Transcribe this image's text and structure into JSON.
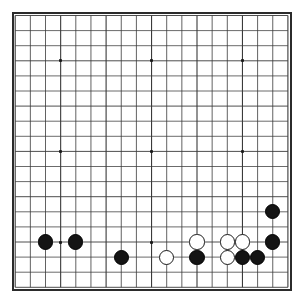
{
  "board": {
    "game": "Go",
    "size": 19,
    "columns": 19,
    "rows": 19,
    "label": "go-board-19x19",
    "colors": {
      "background": "#ffffff",
      "grid_line": "#3a3a3a",
      "border": "#2b2b2b",
      "black_stone": "#141414",
      "white_stone": "#ffffff",
      "white_stone_outline": "#1a1a1a",
      "hoshi": "#1b1b1b"
    },
    "geometry": {
      "origin_x": 15.2,
      "origin_y": 15.5,
      "spacing_x": 15.15,
      "spacing_y": 15.1,
      "stone_radius": 7.6,
      "hoshi_size": 3
    },
    "hoshi_points": [
      {
        "col": 4,
        "row": 4
      },
      {
        "col": 10,
        "row": 4
      },
      {
        "col": 16,
        "row": 4
      },
      {
        "col": 4,
        "row": 10
      },
      {
        "col": 10,
        "row": 10
      },
      {
        "col": 16,
        "row": 10
      },
      {
        "col": 4,
        "row": 16
      },
      {
        "col": 10,
        "row": 16
      },
      {
        "col": 16,
        "row": 16
      }
    ],
    "stones": [
      {
        "color": "black",
        "col": 3,
        "row": 16
      },
      {
        "color": "black",
        "col": 5,
        "row": 16
      },
      {
        "color": "black",
        "col": 8,
        "row": 17
      },
      {
        "color": "white",
        "col": 11,
        "row": 17
      },
      {
        "color": "white",
        "col": 13,
        "row": 16
      },
      {
        "color": "black",
        "col": 13,
        "row": 17
      },
      {
        "color": "white",
        "col": 15,
        "row": 16
      },
      {
        "color": "white",
        "col": 15,
        "row": 17
      },
      {
        "color": "white",
        "col": 16,
        "row": 16
      },
      {
        "color": "black",
        "col": 16,
        "row": 17
      },
      {
        "color": "black",
        "col": 17,
        "row": 17
      },
      {
        "color": "black",
        "col": 18,
        "row": 16
      },
      {
        "color": "black",
        "col": 18,
        "row": 14
      }
    ],
    "counts": {
      "black_stones": "8",
      "white_stones": "5",
      "total_stones": "13"
    }
  }
}
